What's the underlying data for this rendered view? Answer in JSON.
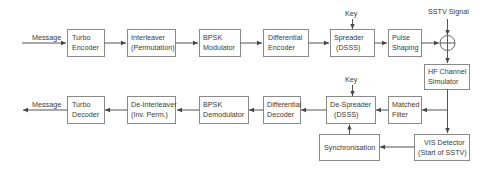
{
  "diagram": {
    "inputs": {
      "message_in": "Message",
      "key_tx": "Key",
      "sstv_signal": "SSTV Signal",
      "key_rx": "Key",
      "message_out": "Message"
    },
    "transmitter": [
      {
        "id": "turbo-encoder",
        "line1": "Turbo",
        "line2": "Encoder"
      },
      {
        "id": "interleaver",
        "line1": "Interleaver",
        "line2": "(Permutation)"
      },
      {
        "id": "bpsk-modulator",
        "line1": "BPSK",
        "line2": "Modulator"
      },
      {
        "id": "differential-encoder",
        "line1": "Differential",
        "line2": "Encoder"
      },
      {
        "id": "spreader",
        "line1": "Spreader",
        "line2": "(DSSS)"
      },
      {
        "id": "pulse-shaping",
        "line1": "Pulse",
        "line2": "Shaping"
      }
    ],
    "summer": {
      "symbol": "+"
    },
    "channel": {
      "id": "hf-channel-simulator",
      "line1": "HF Channel",
      "line2": "Simulator"
    },
    "receiver": [
      {
        "id": "matched-filter",
        "line1": "Matched",
        "line2": "Filter"
      },
      {
        "id": "de-spreader",
        "line1": "De-Spreader",
        "line2": "(DSSS)"
      },
      {
        "id": "differential-decoder",
        "line1": "Differential",
        "line2": "Decoder"
      },
      {
        "id": "bpsk-demodulator",
        "line1": "BPSK",
        "line2": "Demodulator"
      },
      {
        "id": "de-interleaver",
        "line1": "De-Interleaver",
        "line2": "(Inv. Perm.)"
      },
      {
        "id": "turbo-decoder",
        "line1": "Turbo",
        "line2": "Decoder"
      }
    ],
    "vis_detector": {
      "line1": "VIS Detector",
      "line2": "(Start of SSTV)"
    },
    "synchronisation": {
      "label": "Synchronisation"
    },
    "colors": {
      "box_border": "#8a8a8a",
      "line": "#555555",
      "text": "#3a3a3a"
    }
  }
}
